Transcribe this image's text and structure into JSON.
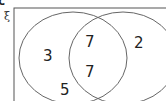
{
  "part_label": "c",
  "universal_symbol": "ξ",
  "regions": {
    "left_only_top": "3",
    "left_only_bottom": "5",
    "intersection_top": "7",
    "intersection_bottom": "7",
    "right_only": "2"
  },
  "colors": {
    "stroke": "#555555",
    "text": "#222222"
  }
}
